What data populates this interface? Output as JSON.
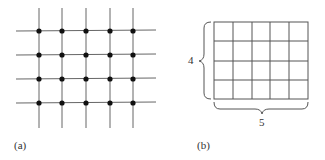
{
  "panel_a": {
    "label": "(a)",
    "rows": 4,
    "cols": 5,
    "description": "lattice of 4 horizontal and 5 vertical lines with dots at intersections"
  },
  "panel_b": {
    "label": "(b)",
    "rows": 4,
    "cols": 5,
    "height_label": "4",
    "width_label": "5",
    "description": "4x5 grid of squares with braces indicating dimensions"
  },
  "colors": {
    "line": "#555555",
    "dot": "#111111"
  }
}
